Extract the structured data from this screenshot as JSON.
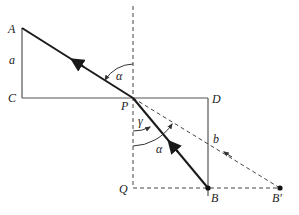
{
  "diagram": {
    "type": "optics-refraction",
    "points": {
      "A": {
        "label": "A",
        "x": 22,
        "y": 28
      },
      "C": {
        "label": "C",
        "x": 22,
        "y": 98
      },
      "P": {
        "label": "P",
        "x": 133,
        "y": 98
      },
      "D": {
        "label": "D",
        "x": 208,
        "y": 98
      },
      "Q": {
        "label": "Q",
        "x": 133,
        "y": 188
      },
      "B": {
        "label": "B",
        "x": 208,
        "y": 188
      },
      "Bprime": {
        "label": "B′",
        "x": 280,
        "y": 188
      }
    },
    "segment_labels": {
      "a": "a",
      "b": "b"
    },
    "angle_labels": {
      "alpha_top": "α",
      "gamma": "γ",
      "alpha_bottom": "α"
    },
    "colors": {
      "solid_line": "#555555",
      "ray": "#1a1a1a",
      "dashed": "#444444",
      "background": "#ffffff"
    }
  }
}
